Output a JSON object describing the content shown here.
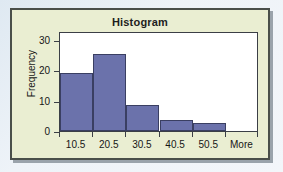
{
  "figure": {
    "background_color": "#eaeed2",
    "border_color": "#4a4f4a",
    "paper_color": "#e6eef5"
  },
  "chart_data": {
    "type": "bar",
    "title": "Histogram",
    "xlabel": "",
    "ylabel": "Frequency",
    "categories": [
      "10.5",
      "20.5",
      "30.5",
      "40.5",
      "50.5",
      "More"
    ],
    "values": [
      19,
      25.5,
      8.5,
      3.5,
      2.5,
      0
    ],
    "ylim": [
      0,
      33
    ],
    "yticks": [
      0,
      10,
      20,
      30
    ],
    "ytick_labels": [
      "0",
      "10",
      "20",
      "30"
    ],
    "xtick_labels": [
      "10.5",
      "20.5",
      "30.5",
      "40.5",
      "50.5",
      "More"
    ],
    "grid": false,
    "legend": false,
    "bar_color": "#6b72ab",
    "bar_edge_color": "#3a3f62",
    "plot_background": "#ffffff"
  }
}
